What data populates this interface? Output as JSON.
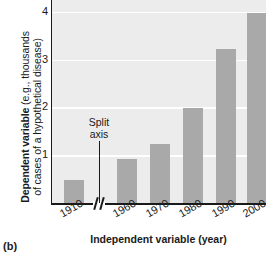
{
  "chart_data": {
    "type": "bar",
    "title": "",
    "subtitle": "",
    "xlabel": "Independent variable (year)",
    "ylabel_strong": "Dependent variable",
    "ylabel_rest": " (e.g., thousands",
    "ylabel_line2": "of cases of a hypothetical disease)",
    "ylabel_full": "Dependent variable (e.g., thousands of cases of a hypothetical disease)",
    "categories": [
      "1910",
      "1960",
      "1970",
      "1980",
      "1990",
      "2000"
    ],
    "values": [
      0.5,
      0.95,
      1.25,
      2.0,
      3.25,
      4.0
    ],
    "yticks": [
      1,
      2,
      3,
      4
    ],
    "ytick_labels": [
      "1",
      "2",
      "3",
      "4"
    ],
    "ylim": [
      0,
      4.25
    ],
    "grid": "horizontal-white",
    "legend": "none",
    "annotations": [
      {
        "name": "split-axis",
        "line1": "Split",
        "line2": "axis",
        "text": "Split axis",
        "points_to": "x-axis break between 1910 and 1960"
      }
    ],
    "axis_break": {
      "axis": "x",
      "between": [
        "1910",
        "1960"
      ],
      "marker": "double-slash"
    },
    "colors": {
      "bar_fill": "#a9a9a9",
      "plot_background": "#ececec",
      "gridline": "#ffffff",
      "axis_line": "#1a1a1a",
      "text": "#1a1a1a",
      "page_background": "#ffffff"
    }
  },
  "caption": {
    "label": "(b)"
  }
}
